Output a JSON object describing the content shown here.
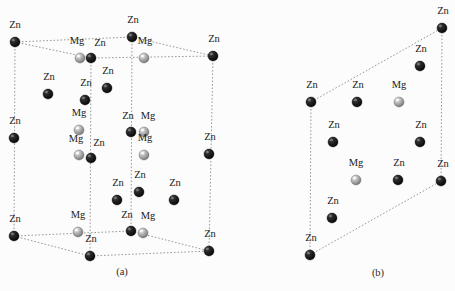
{
  "figure": {
    "background_color": "#fcfcfc",
    "species": {
      "zinc": {
        "symbol": "Zn",
        "color": "#0d0d0d",
        "highlight_color": "#6b6b6b",
        "radius": 5.0
      },
      "magnesium": {
        "symbol": "Mg",
        "color": "#9c9c9c",
        "highlight_color": "#ececec",
        "radius": 5.0
      }
    },
    "edge_color": "#8d8d8d",
    "captions": [
      {
        "id": "caption-a",
        "text": "(a)",
        "x": 122,
        "y": 275
      },
      {
        "id": "caption-b",
        "text": "(b)",
        "x": 378,
        "y": 276
      }
    ],
    "panels": [
      {
        "id": "panel-a",
        "caption": "(a)",
        "edges": [
          {
            "x1": 15,
            "y1": 42,
            "x2": 132,
            "y2": 37
          },
          {
            "x1": 132,
            "y1": 37,
            "x2": 213,
            "y2": 56
          },
          {
            "x1": 15,
            "y1": 42,
            "x2": 91,
            "y2": 58
          },
          {
            "x1": 91,
            "y1": 58,
            "x2": 213,
            "y2": 56
          },
          {
            "x1": 15,
            "y1": 42,
            "x2": 14,
            "y2": 236
          },
          {
            "x1": 132,
            "y1": 37,
            "x2": 131,
            "y2": 231
          },
          {
            "x1": 213,
            "y1": 56,
            "x2": 209,
            "y2": 251
          },
          {
            "x1": 91,
            "y1": 58,
            "x2": 90,
            "y2": 256
          },
          {
            "x1": 14,
            "y1": 236,
            "x2": 131,
            "y2": 231
          },
          {
            "x1": 131,
            "y1": 231,
            "x2": 209,
            "y2": 251
          },
          {
            "x1": 14,
            "y1": 236,
            "x2": 90,
            "y2": 256
          },
          {
            "x1": 90,
            "y1": 256,
            "x2": 209,
            "y2": 251
          }
        ],
        "atoms": [
          {
            "species": "Zn",
            "x": 15,
            "y": 42,
            "label": "Zn",
            "lx": 15,
            "ly": 28
          },
          {
            "species": "Zn",
            "x": 132,
            "y": 37,
            "label": "Zn",
            "lx": 133,
            "ly": 23
          },
          {
            "species": "Zn",
            "x": 213,
            "y": 56,
            "label": "Zn",
            "lx": 214,
            "ly": 42
          },
          {
            "species": "Mg",
            "x": 80,
            "y": 58,
            "label": "Mg",
            "lx": 77,
            "ly": 44
          },
          {
            "species": "Zn",
            "x": 91,
            "y": 58,
            "label": "Zn",
            "lx": 100,
            "ly": 46
          },
          {
            "species": "Mg",
            "x": 144,
            "y": 58,
            "label": "Mg",
            "lx": 145,
            "ly": 44
          },
          {
            "species": "Zn",
            "x": 48,
            "y": 94,
            "label": "Zn",
            "lx": 49,
            "ly": 80
          },
          {
            "species": "Zn",
            "x": 107,
            "y": 88,
            "label": "Zn",
            "lx": 108,
            "ly": 74
          },
          {
            "species": "Zn",
            "x": 85,
            "y": 100,
            "label": "Zn",
            "lx": 86,
            "ly": 86
          },
          {
            "species": "Zn",
            "x": 14,
            "y": 138,
            "label": "Zn",
            "lx": 15,
            "ly": 124
          },
          {
            "species": "Mg",
            "x": 79,
            "y": 130,
            "label": "Mg",
            "lx": 79,
            "ly": 116
          },
          {
            "species": "Zn",
            "x": 131,
            "y": 132,
            "label": "Zn",
            "lx": 128,
            "ly": 119
          },
          {
            "species": "Mg",
            "x": 144,
            "y": 132,
            "label": "Mg",
            "lx": 148,
            "ly": 119
          },
          {
            "species": "Mg",
            "x": 79,
            "y": 155,
            "label": "Mg",
            "lx": 76,
            "ly": 142
          },
          {
            "species": "Zn",
            "x": 91,
            "y": 158,
            "label": "Zn",
            "lx": 99,
            "ly": 146
          },
          {
            "species": "Mg",
            "x": 144,
            "y": 155,
            "label": "Mg",
            "lx": 145,
            "ly": 141
          },
          {
            "species": "Zn",
            "x": 209,
            "y": 154,
            "label": "Zn",
            "lx": 210,
            "ly": 140
          },
          {
            "species": "Zn",
            "x": 139,
            "y": 192,
            "label": "Zn",
            "lx": 140,
            "ly": 178
          },
          {
            "species": "Zn",
            "x": 117,
            "y": 200,
            "label": "Zn",
            "lx": 118,
            "ly": 186
          },
          {
            "species": "Zn",
            "x": 174,
            "y": 200,
            "label": "Zn",
            "lx": 175,
            "ly": 186
          },
          {
            "species": "Mg",
            "x": 78,
            "y": 232,
            "label": "Mg",
            "lx": 78,
            "ly": 218
          },
          {
            "species": "Zn",
            "x": 131,
            "y": 231,
            "label": "Zn",
            "lx": 127,
            "ly": 218
          },
          {
            "species": "Mg",
            "x": 143,
            "y": 233,
            "label": "Mg",
            "lx": 148,
            "ly": 219
          },
          {
            "species": "Zn",
            "x": 14,
            "y": 236,
            "label": "Zn",
            "lx": 15,
            "ly": 222
          },
          {
            "species": "Zn",
            "x": 209,
            "y": 251,
            "label": "Zn",
            "lx": 210,
            "ly": 237
          },
          {
            "species": "Zn",
            "x": 90,
            "y": 256,
            "label": "Zn",
            "lx": 91,
            "ly": 242
          }
        ]
      },
      {
        "id": "panel-b",
        "caption": "(b)",
        "edges": [
          {
            "x1": 311,
            "y1": 102,
            "x2": 442,
            "y2": 28
          },
          {
            "x1": 442,
            "y1": 28,
            "x2": 441,
            "y2": 181
          },
          {
            "x1": 311,
            "y1": 102,
            "x2": 310,
            "y2": 255
          },
          {
            "x1": 310,
            "y1": 255,
            "x2": 441,
            "y2": 181
          }
        ],
        "atoms": [
          {
            "species": "Zn",
            "x": 442,
            "y": 28,
            "label": "Zn",
            "lx": 443,
            "ly": 14
          },
          {
            "species": "Zn",
            "x": 420,
            "y": 66,
            "label": "Zn",
            "lx": 421,
            "ly": 52
          },
          {
            "species": "Zn",
            "x": 311,
            "y": 102,
            "label": "Zn",
            "lx": 312,
            "ly": 88
          },
          {
            "species": "Zn",
            "x": 357,
            "y": 102,
            "label": "Zn",
            "lx": 358,
            "ly": 88
          },
          {
            "species": "Mg",
            "x": 399,
            "y": 102,
            "label": "Mg",
            "lx": 399,
            "ly": 88
          },
          {
            "species": "Zn",
            "x": 333,
            "y": 142,
            "label": "Zn",
            "lx": 334,
            "ly": 128
          },
          {
            "species": "Zn",
            "x": 420,
            "y": 142,
            "label": "Zn",
            "lx": 421,
            "ly": 128
          },
          {
            "species": "Mg",
            "x": 356,
            "y": 180,
            "label": "Mg",
            "lx": 356,
            "ly": 166
          },
          {
            "species": "Zn",
            "x": 398,
            "y": 180,
            "label": "Zn",
            "lx": 399,
            "ly": 166
          },
          {
            "species": "Zn",
            "x": 441,
            "y": 181,
            "label": "Zn",
            "lx": 443,
            "ly": 167
          },
          {
            "species": "Zn",
            "x": 332,
            "y": 218,
            "label": "Zn",
            "lx": 333,
            "ly": 204
          },
          {
            "species": "Zn",
            "x": 310,
            "y": 255,
            "label": "Zn",
            "lx": 311,
            "ly": 241
          }
        ]
      }
    ]
  }
}
